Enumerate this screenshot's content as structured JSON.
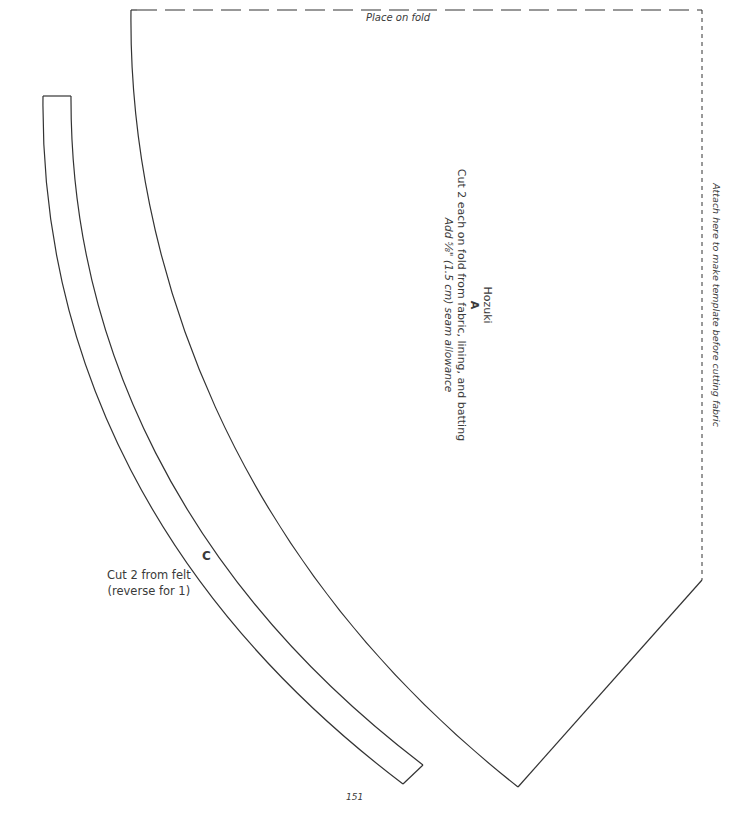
{
  "page": {
    "page_number": "151"
  },
  "piece_a": {
    "fold_label": "Place on fold",
    "name": "Hozuki",
    "letter": "A",
    "cut_instruction": "Cut 2 each on fold from fabric, lining, and batting",
    "seam_instruction": "Add ⅝\" (1.5 cm) seam allowance",
    "attach_note": "Attach here to make template before cutting fabric"
  },
  "piece_c": {
    "letter": "C",
    "cut_instruction_line1": "Cut 2 from felt",
    "cut_instruction_line2": "(reverse for 1)"
  },
  "colors": {
    "line": "#333333",
    "text": "#3a3a3a",
    "background": "#ffffff"
  }
}
